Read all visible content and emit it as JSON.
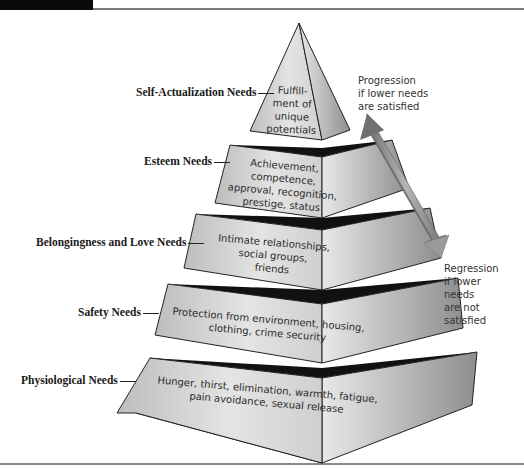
{
  "levels": [
    {
      "name": "Self-Actualization Needs",
      "description_lines": [
        "Fulfill-",
        "ment of",
        "unique",
        "potentials"
      ]
    },
    {
      "name": "Esteem Needs",
      "description_lines": [
        "Achievement,",
        "competence,",
        "approval, recognition,",
        "prestige, status"
      ]
    },
    {
      "name": "Belongingness and Love Needs",
      "description_lines": [
        "Intimate relationships,",
        "social groups,",
        "friends"
      ]
    },
    {
      "name": "Safety Needs",
      "description_lines": [
        "Protection from environment, housing,",
        "clothing, crime security"
      ]
    },
    {
      "name": "Physiological Needs",
      "description_lines": [
        "Hunger, thirst, elimination, warmth, fatigue,",
        "pain avoidance, sexual release"
      ]
    }
  ],
  "arrows": {
    "progression_lines": [
      "Progression",
      "if lower needs",
      "are satisfied"
    ],
    "regression_lines": [
      "Regression",
      "if lower",
      "needs",
      "are not",
      "satisfied"
    ]
  },
  "colors": {
    "face_light": "#d9d9d9",
    "face_dark": "#9a9a9a",
    "band": "#111111",
    "arrow": "#7d7d7d"
  }
}
